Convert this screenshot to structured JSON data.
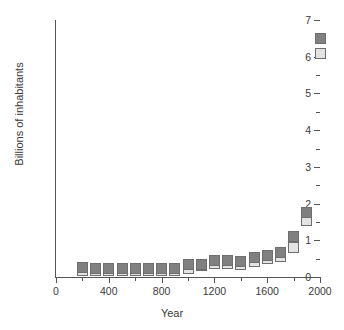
{
  "chart_data": {
    "type": "scatter",
    "title": "",
    "xlabel": "Year",
    "ylabel": "Billions of inhabitants",
    "xlim": [
      0,
      2000
    ],
    "ylim": [
      0,
      7
    ],
    "grid": false,
    "legend": "none",
    "x_ticks_major": [
      0,
      400,
      800,
      1200,
      1600,
      2000
    ],
    "x_ticks_minor": [
      200,
      600,
      1000,
      1400,
      1800
    ],
    "y_ticks_major": [
      0,
      1,
      2,
      3,
      4,
      5,
      6,
      7
    ],
    "y_ticks_minor": [
      0.5,
      1.5,
      2.5,
      3.5,
      4.5,
      5.5,
      6.5
    ],
    "x_tick_labels": [
      "0",
      "400",
      "800",
      "1200",
      "1600",
      "2000"
    ],
    "y_tick_labels": [
      "0",
      "1",
      "2",
      "3",
      "4",
      "5",
      "6",
      "7"
    ],
    "marker": "square",
    "colors": {
      "high_estimate": "#808080",
      "low_estimate": "#e3e3e3",
      "marker_border": "#6e6e6e",
      "axis": "#555555",
      "text": "#3a3a3a",
      "background": "#ffffff"
    },
    "x": [
      200,
      300,
      400,
      500,
      600,
      700,
      800,
      900,
      1000,
      1100,
      1200,
      1300,
      1400,
      1500,
      1600,
      1700,
      1800,
      1900,
      1950,
      2000
    ],
    "series": [
      {
        "name": "High estimate",
        "key": "high",
        "values": [
          0.26,
          0.22,
          0.22,
          0.23,
          0.24,
          0.23,
          0.24,
          0.24,
          0.34,
          0.33,
          0.45,
          0.44,
          0.43,
          0.54,
          0.58,
          0.68,
          1.1,
          1.75,
          2.52,
          6.5
        ]
      },
      {
        "name": "Low estimate",
        "key": "low",
        "values": [
          0.19,
          0.19,
          0.19,
          0.19,
          0.19,
          0.19,
          0.19,
          0.19,
          0.24,
          0.3,
          0.36,
          0.36,
          0.35,
          0.42,
          0.5,
          0.57,
          0.81,
          1.55,
          2.5,
          6.1
        ]
      }
    ],
    "points_high": [
      {
        "year": 200,
        "value": 0.26
      },
      {
        "year": 300,
        "value": 0.22
      },
      {
        "year": 400,
        "value": 0.22
      },
      {
        "year": 500,
        "value": 0.23
      },
      {
        "year": 600,
        "value": 0.24
      },
      {
        "year": 700,
        "value": 0.23
      },
      {
        "year": 800,
        "value": 0.24
      },
      {
        "year": 900,
        "value": 0.24
      },
      {
        "year": 1000,
        "value": 0.34
      },
      {
        "year": 1100,
        "value": 0.33
      },
      {
        "year": 1200,
        "value": 0.45
      },
      {
        "year": 1300,
        "value": 0.44
      },
      {
        "year": 1400,
        "value": 0.43
      },
      {
        "year": 1500,
        "value": 0.54
      },
      {
        "year": 1600,
        "value": 0.58
      },
      {
        "year": 1700,
        "value": 0.68
      },
      {
        "year": 1800,
        "value": 1.1
      },
      {
        "year": 1900,
        "value": 1.75
      },
      {
        "year": 2000,
        "value": 6.5
      }
    ],
    "points_low": [
      {
        "year": 200,
        "value": 0.19
      },
      {
        "year": 300,
        "value": 0.19
      },
      {
        "year": 400,
        "value": 0.19
      },
      {
        "year": 500,
        "value": 0.19
      },
      {
        "year": 600,
        "value": 0.19
      },
      {
        "year": 700,
        "value": 0.19
      },
      {
        "year": 800,
        "value": 0.19
      },
      {
        "year": 900,
        "value": 0.19
      },
      {
        "year": 1000,
        "value": 0.24
      },
      {
        "year": 1100,
        "value": 0.3
      },
      {
        "year": 1200,
        "value": 0.36
      },
      {
        "year": 1300,
        "value": 0.36
      },
      {
        "year": 1400,
        "value": 0.35
      },
      {
        "year": 1500,
        "value": 0.42
      },
      {
        "year": 1600,
        "value": 0.5
      },
      {
        "year": 1700,
        "value": 0.57
      },
      {
        "year": 1800,
        "value": 0.81
      },
      {
        "year": 1900,
        "value": 1.55
      },
      {
        "year": 2000,
        "value": 6.1
      }
    ]
  }
}
